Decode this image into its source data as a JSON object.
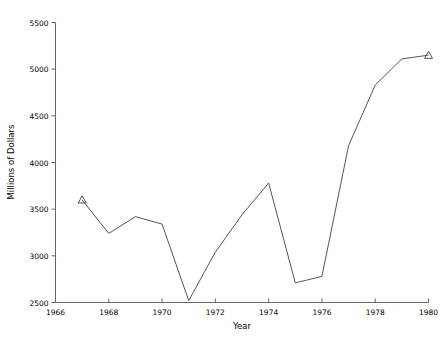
{
  "chart_data": {
    "type": "line",
    "title": "",
    "xlabel": "Year",
    "ylabel": "Millions of Dollars",
    "xlim": [
      1966,
      1980
    ],
    "ylim": [
      2500,
      5500
    ],
    "xticks": [
      1966,
      1968,
      1970,
      1972,
      1974,
      1976,
      1978,
      1980
    ],
    "xtick_labels": [
      "1966",
      "1968",
      "1970",
      "1972",
      "1974",
      "1976",
      "1978",
      "1980"
    ],
    "yticks": [
      2500,
      3000,
      3500,
      4000,
      4500,
      5000,
      5500
    ],
    "ytick_labels": [
      "2500",
      "3000",
      "3500",
      "4000",
      "4500",
      "5000",
      "5500"
    ],
    "grid": false,
    "legend": "none",
    "line_color": "#555555",
    "marker": "triangle-up",
    "marker_points": [
      {
        "x": 1967,
        "y": 3600
      },
      {
        "x": 1980,
        "y": 5150
      }
    ],
    "x": [
      1967,
      1968,
      1969,
      1970,
      1971,
      1972,
      1973,
      1974,
      1975,
      1976,
      1977,
      1978,
      1979,
      1980
    ],
    "values": [
      3600,
      3240,
      3420,
      3340,
      2520,
      3040,
      3440,
      3780,
      2710,
      2780,
      4180,
      4830,
      5110,
      5150
    ],
    "series": [
      {
        "name": "Millions of Dollars",
        "values": [
          3600,
          3240,
          3420,
          3340,
          2520,
          3040,
          3440,
          3780,
          2710,
          2780,
          4180,
          4830,
          5110,
          5150
        ]
      }
    ]
  },
  "axis": {
    "x_title": "Year",
    "y_title": "Millions of Dollars"
  }
}
